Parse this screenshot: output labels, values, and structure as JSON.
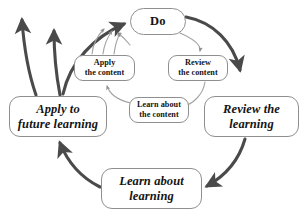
{
  "diagram": {
    "type": "cycle",
    "colors": {
      "node_border": "#8f8f8f",
      "node_fill": "#ffffff",
      "outer_arrow": "#4a4a4a",
      "inner_arrow": "#9a9a9a",
      "text": "#141414",
      "background": "#ffffff"
    },
    "outer_cycle": {
      "nodes": [
        {
          "id": "do",
          "label": "Do",
          "shape": "pill",
          "emphasis": "bold"
        },
        {
          "id": "review-the-learning",
          "label": "Review the\nlearning",
          "shape": "rounded-rect",
          "emphasis": "bold-italic"
        },
        {
          "id": "learn-about-learning",
          "label": "Learn about\nlearning",
          "shape": "rounded-rect",
          "emphasis": "bold-italic"
        },
        {
          "id": "apply-to-future-learning",
          "label": "Apply to\nfuture learning",
          "shape": "rounded-rect",
          "emphasis": "bold-italic"
        }
      ],
      "edges": [
        {
          "from": "do",
          "to": "review-the-learning",
          "style": "thick"
        },
        {
          "from": "review-the-learning",
          "to": "learn-about-learning",
          "style": "thick"
        },
        {
          "from": "learn-about-learning",
          "to": "apply-to-future-learning",
          "style": "thick"
        },
        {
          "from": "apply-to-future-learning",
          "to": "do",
          "style": "thick"
        }
      ]
    },
    "inner_cycle": {
      "nodes": [
        {
          "id": "review-the-content",
          "label": "Review\nthe content",
          "shape": "rounded-rect",
          "emphasis": "bold"
        },
        {
          "id": "learn-about-the-content",
          "label": "Learn about\nthe content",
          "shape": "rounded-rect",
          "emphasis": "bold"
        },
        {
          "id": "apply-the-content",
          "label": "Apply\nthe content",
          "shape": "rounded-rect",
          "emphasis": "bold"
        }
      ],
      "edges": [
        {
          "from": "do",
          "to": "review-the-content",
          "style": "thin"
        },
        {
          "from": "review-the-content",
          "to": "learn-about-the-content",
          "style": "thin"
        },
        {
          "from": "learn-about-the-content",
          "to": "apply-the-content",
          "style": "thin"
        },
        {
          "from": "apply-the-content",
          "to": "do",
          "style": "thin"
        }
      ]
    },
    "outbound_arrows": {
      "count": 2,
      "description": "two thick arrows leaving upward-left from Apply to future learning",
      "style": "thick"
    }
  }
}
